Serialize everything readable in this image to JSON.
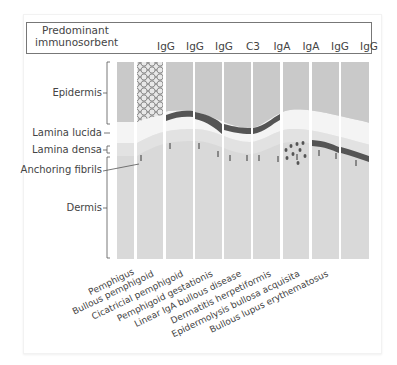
{
  "header": {
    "label_line1": "Predominant",
    "label_line2": "immunosorbent",
    "antibodies": [
      "IgG",
      "IgG",
      "IgG",
      "C3",
      "IgA",
      "IgA",
      "IgG",
      "IgG"
    ]
  },
  "layers": {
    "epidermis": "Epidermis",
    "lamina_lucida": "Lamina lucida",
    "lamina_densa": "Lamina densa",
    "anchoring_fibrils": "Anchoring fibrils",
    "dermis": "Dermis"
  },
  "diseases": [
    "Pemphigus",
    "Bullous pemphigoid",
    "Cicatricial pemphigoid",
    "Pemphigoid gestationis",
    "Linear IgA bullous disease",
    "Dermatitis herpetiformis",
    "Epidermolysis bullosa acquisita",
    "Bullous lupus erythematosus"
  ],
  "colors": {
    "epidermis": "#c8c8c8",
    "lamina_lucida": "#f3f3f3",
    "lamina_densa": "#dcdcdc",
    "dermis": "#d7d7d7",
    "deposit": "#555555",
    "fibril": "#888888"
  }
}
